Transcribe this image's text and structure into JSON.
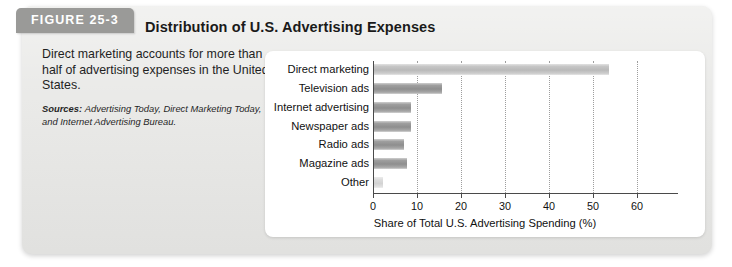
{
  "figure": {
    "tab_label": "FIGURE 25-3",
    "caption": "Direct marketing accounts for more than half of advertising expenses in the United States.",
    "sources_label": "Sources:",
    "sources_text": "Advertising Today, Direct Marketing Today, and Internet Advertising Bureau.",
    "panel_color": "#e9e9e7",
    "tab_color": "#9a9a98",
    "bar_color": "#9e9e9e",
    "bar_color_light": "#c6c6c6"
  },
  "chart_data": {
    "type": "bar",
    "orientation": "horizontal",
    "title": "Distribution of U.S. Advertising Expenses",
    "xlabel": "Share of Total U.S. Advertising Spending (%)",
    "ylabel": "",
    "categories": [
      "Direct marketing",
      "Television ads",
      "Internet advertising",
      "Newspaper ads",
      "Radio ads",
      "Magazine ads",
      "Other"
    ],
    "values": [
      53.5,
      15.5,
      8.5,
      8.5,
      6.8,
      7.5,
      2.0
    ],
    "xlim": [
      0,
      68
    ],
    "xticks": [
      0,
      10,
      20,
      30,
      40,
      50,
      60
    ],
    "xtick_labels": [
      "0",
      "10",
      "20",
      "30",
      "40",
      "50",
      "60"
    ],
    "grid": "vertical-dotted",
    "legend": "none"
  }
}
